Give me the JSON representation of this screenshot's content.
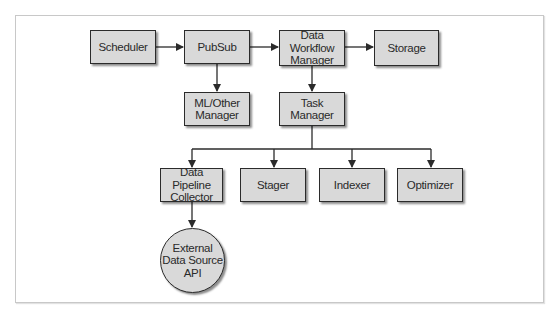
{
  "diagram": {
    "nodes": [
      {
        "id": "scheduler",
        "label": "Scheduler",
        "shape": "rect"
      },
      {
        "id": "pubsub",
        "label": "PubSub",
        "shape": "rect"
      },
      {
        "id": "data_workflow_manager",
        "label": "Data Workflow\nManager",
        "shape": "rect"
      },
      {
        "id": "storage",
        "label": "Storage",
        "shape": "rect"
      },
      {
        "id": "ml_other_manager",
        "label": "ML/Other\nManager",
        "shape": "rect"
      },
      {
        "id": "task_manager",
        "label": "Task\nManager",
        "shape": "rect"
      },
      {
        "id": "data_pipeline_collector",
        "label": "Data Pipeline\nCollector",
        "shape": "rect"
      },
      {
        "id": "stager",
        "label": "Stager",
        "shape": "rect"
      },
      {
        "id": "indexer",
        "label": "Indexer",
        "shape": "rect"
      },
      {
        "id": "optimizer",
        "label": "Optimizer",
        "shape": "rect"
      },
      {
        "id": "external_data_source_api",
        "label": "External\nData Source\nAPI",
        "shape": "circle"
      }
    ],
    "edges": [
      {
        "from": "scheduler",
        "to": "pubsub"
      },
      {
        "from": "pubsub",
        "to": "data_workflow_manager"
      },
      {
        "from": "data_workflow_manager",
        "to": "storage"
      },
      {
        "from": "pubsub",
        "to": "ml_other_manager"
      },
      {
        "from": "data_workflow_manager",
        "to": "task_manager"
      },
      {
        "from": "task_manager",
        "to": "data_pipeline_collector"
      },
      {
        "from": "task_manager",
        "to": "stager"
      },
      {
        "from": "task_manager",
        "to": "indexer"
      },
      {
        "from": "task_manager",
        "to": "optimizer"
      },
      {
        "from": "data_pipeline_collector",
        "to": "external_data_source_api"
      }
    ],
    "colors": {
      "node_fill": "#d9d9d9",
      "node_border": "#2b2b2b",
      "edge": "#2b2b2b",
      "frame_border": "#c8c8c8"
    }
  }
}
